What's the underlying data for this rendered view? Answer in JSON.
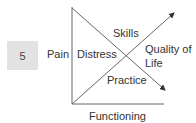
{
  "figure": {
    "number": "5",
    "labels": {
      "left": "Pain",
      "inner_left": "Distress",
      "top": "Skills",
      "right_line1": "Quality of",
      "right_line2": "Life",
      "bottom_inner": "Practice",
      "x_axis": "Functioning"
    },
    "colors": {
      "badge_bg": "#e2e2e2",
      "line": "#555555",
      "text": "#333333"
    }
  }
}
